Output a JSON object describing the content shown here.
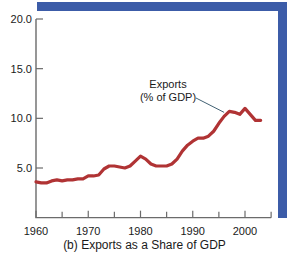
{
  "caption": "(b) Exports as a Share of GDP",
  "colors": {
    "series": "#b03334",
    "band": "#3c5ca8",
    "axis": "#6b6b6b",
    "leader": "#2d4f63",
    "text": "#1a1a1a",
    "background": "#ffffff"
  },
  "annotation": {
    "line1": "Exports",
    "line2": "(% of GDP)"
  },
  "chart_data": {
    "type": "line",
    "title": "(b) Exports as a Share of GDP",
    "xlabel": "",
    "ylabel": "",
    "xlim": [
      1960,
      2005
    ],
    "ylim": [
      0,
      20
    ],
    "grid": false,
    "legend": "none",
    "yticks": [
      5.0,
      10.0,
      15.0,
      20.0
    ],
    "ytick_labels": [
      "5.0",
      "10.0",
      "15.0",
      "20.0"
    ],
    "xticks": [
      1960,
      1970,
      1980,
      1990,
      2000
    ],
    "xtick_labels": [
      "1960",
      "1970",
      "1980",
      "1990",
      "2000"
    ],
    "xminor_ticks": [
      1965,
      1975,
      1985,
      1995,
      2005
    ],
    "annotations": [
      {
        "text": "Exports (% of GDP)",
        "x": 1992.5,
        "y": 13.5,
        "points_to_x": 1996.0,
        "points_to_y": 10.6
      }
    ],
    "series": [
      {
        "name": "Exports (% of GDP)",
        "color": "#b03334",
        "x": [
          1960,
          1961,
          1962,
          1963,
          1964,
          1965,
          1966,
          1967,
          1968,
          1969,
          1970,
          1971,
          1972,
          1973,
          1974,
          1975,
          1976,
          1977,
          1978,
          1979,
          1980,
          1981,
          1982,
          1983,
          1984,
          1985,
          1986,
          1987,
          1988,
          1989,
          1990,
          1991,
          1992,
          1993,
          1994,
          1995,
          1996,
          1997,
          1998,
          1999,
          2000,
          2001,
          2002,
          2003
        ],
        "values": [
          3.6,
          3.5,
          3.5,
          3.7,
          3.8,
          3.7,
          3.8,
          3.8,
          3.9,
          3.9,
          4.2,
          4.2,
          4.3,
          4.9,
          5.2,
          5.2,
          5.1,
          5.0,
          5.2,
          5.7,
          6.2,
          5.9,
          5.4,
          5.2,
          5.2,
          5.2,
          5.4,
          5.9,
          6.7,
          7.3,
          7.7,
          8.0,
          8.0,
          8.2,
          8.7,
          9.5,
          10.2,
          10.7,
          10.6,
          10.4,
          11.0,
          10.4,
          9.8,
          9.8
        ]
      }
    ]
  }
}
